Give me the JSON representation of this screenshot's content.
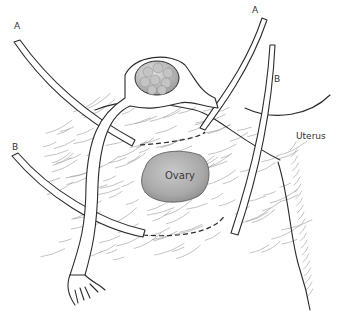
{
  "diagram": {
    "labels": {
      "a_left": "A",
      "a_right": "A",
      "b_left": "B",
      "b_right": "B",
      "uterus": "Uterus",
      "ovary": "Ovary"
    },
    "colors": {
      "ovary_fill": "#a8a8a8",
      "follicle_fill": "#b5b5b5",
      "outline": "#2b2b2b",
      "hatch": "#9a9a9a"
    }
  }
}
